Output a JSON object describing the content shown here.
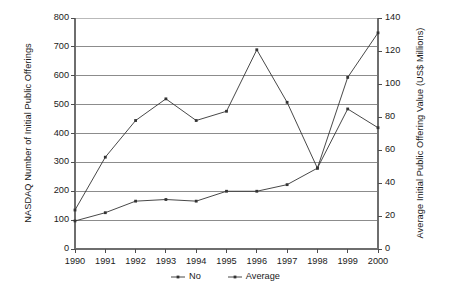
{
  "chart_data": {
    "type": "line",
    "title": "",
    "xlabel": "",
    "categories": [
      "1990",
      "1991",
      "1992",
      "1993",
      "1994",
      "1995",
      "1996",
      "1997",
      "1998",
      "1999",
      "2000"
    ],
    "grid": true,
    "legend_position": "bottom",
    "axes": {
      "left": {
        "label": "NASDAQ Number of Initial Public Offerings",
        "ticks": [
          "0",
          "100",
          "200",
          "300",
          "400",
          "500",
          "600",
          "700",
          "800"
        ],
        "min": 0,
        "max": 800,
        "step": 100
      },
      "right": {
        "label": "Average Initial Public Offering Value (US$ Millions)",
        "ticks": [
          "0",
          "20",
          "40",
          "60",
          "80",
          "100",
          "120",
          "140"
        ],
        "min": 0,
        "max": 140,
        "step": 20
      }
    },
    "series": [
      {
        "name": "No",
        "axis": "left",
        "marker": "square",
        "color": "#333333",
        "values": [
          135,
          318,
          445,
          520,
          445,
          477,
          690,
          508,
          280,
          485,
          420
        ]
      },
      {
        "name": "Average",
        "axis": "right",
        "marker": "square",
        "color": "#333333",
        "values": [
          17,
          22,
          29,
          30,
          29,
          35,
          35,
          39,
          49,
          104,
          131
        ]
      }
    ]
  },
  "legend": {
    "items": [
      {
        "label": "No"
      },
      {
        "label": "Average"
      }
    ]
  }
}
